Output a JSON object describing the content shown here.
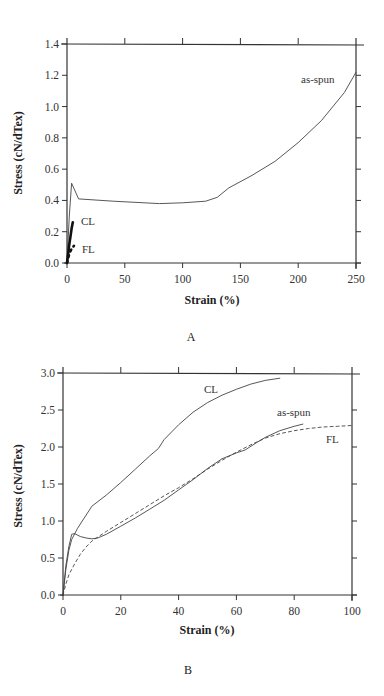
{
  "header": {
    "fragment": "...g ... ...y... ...y..."
  },
  "chart_data": [
    {
      "type": "line",
      "panel": "A",
      "title": "",
      "xlabel": "Strain (%)",
      "ylabel": "Stress (cN/dTex)",
      "xlim": [
        0,
        250
      ],
      "ylim": [
        0,
        1.4
      ],
      "xticks": [
        0,
        50,
        100,
        150,
        200,
        250
      ],
      "yticks": [
        0.0,
        0.2,
        0.4,
        0.6,
        0.8,
        1.0,
        1.2,
        1.4
      ],
      "xtick_labels": [
        "0",
        "50",
        "100",
        "150",
        "200",
        "250"
      ],
      "ytick_labels": [
        "0.0",
        "0.2",
        "0.4",
        "0.6",
        "0.8",
        "1.0",
        "1.2",
        "1.4"
      ],
      "grid": false,
      "legend": "inline labels",
      "series": [
        {
          "name": "as-spun",
          "style": "solid-thin",
          "x": [
            0,
            2,
            4,
            10,
            40,
            80,
            100,
            120,
            130,
            140,
            160,
            180,
            200,
            220,
            240,
            250
          ],
          "y": [
            0.0,
            0.3,
            0.51,
            0.41,
            0.395,
            0.38,
            0.385,
            0.395,
            0.42,
            0.48,
            0.56,
            0.65,
            0.77,
            0.91,
            1.09,
            1.22
          ]
        },
        {
          "name": "CL",
          "style": "solid-thick",
          "x": [
            0,
            1,
            2,
            3,
            4,
            5
          ],
          "y": [
            0.0,
            0.06,
            0.12,
            0.17,
            0.22,
            0.26
          ]
        },
        {
          "name": "FL",
          "style": "dotted-thick",
          "x": [
            0,
            1,
            2,
            4,
            6
          ],
          "y": [
            0.0,
            0.03,
            0.06,
            0.09,
            0.11
          ]
        }
      ],
      "labels": {
        "as_spun": "as-spun",
        "cl": "CL",
        "fl": "FL"
      }
    },
    {
      "type": "line",
      "panel": "B",
      "title": "",
      "xlabel": "Strain (%)",
      "ylabel": "Stress (cN/dTex)",
      "xlim": [
        0,
        100
      ],
      "ylim": [
        0,
        3.0
      ],
      "xticks": [
        0,
        20,
        40,
        60,
        80,
        100
      ],
      "yticks": [
        0.0,
        0.5,
        1.0,
        1.5,
        2.0,
        2.5,
        3.0
      ],
      "xtick_labels": [
        "0",
        "20",
        "40",
        "60",
        "80",
        "100"
      ],
      "ytick_labels": [
        "0.0",
        "0.5",
        "1.0",
        "1.5",
        "2.0",
        "2.5",
        "3.0"
      ],
      "grid": false,
      "legend": "inline labels",
      "series": [
        {
          "name": "CL",
          "style": "solid",
          "x": [
            0,
            1,
            2,
            3,
            5,
            8,
            10,
            15,
            20,
            25,
            30,
            33,
            35,
            40,
            45,
            50,
            55,
            60,
            65,
            70,
            75
          ],
          "y": [
            0.0,
            0.35,
            0.6,
            0.75,
            0.9,
            1.08,
            1.2,
            1.35,
            1.52,
            1.7,
            1.88,
            1.98,
            2.1,
            2.3,
            2.47,
            2.6,
            2.7,
            2.78,
            2.85,
            2.9,
            2.93
          ]
        },
        {
          "name": "as-spun",
          "style": "solid",
          "x": [
            0,
            1,
            2,
            3,
            4,
            6,
            8,
            10,
            12,
            15,
            20,
            25,
            30,
            35,
            40,
            45,
            50,
            55,
            60,
            63,
            67,
            70,
            75,
            80,
            83
          ],
          "y": [
            0.0,
            0.4,
            0.65,
            0.82,
            0.83,
            0.79,
            0.77,
            0.76,
            0.77,
            0.82,
            0.93,
            1.04,
            1.16,
            1.28,
            1.42,
            1.56,
            1.71,
            1.84,
            1.92,
            1.96,
            2.06,
            2.13,
            2.22,
            2.28,
            2.31
          ]
        },
        {
          "name": "FL",
          "style": "dashed",
          "x": [
            0,
            1,
            2,
            4,
            6,
            8,
            10,
            15,
            20,
            25,
            30,
            35,
            40,
            45,
            50,
            55,
            60,
            65,
            70,
            75,
            80,
            85,
            90,
            95,
            100
          ],
          "y": [
            0.0,
            0.15,
            0.27,
            0.42,
            0.55,
            0.65,
            0.73,
            0.86,
            0.98,
            1.1,
            1.22,
            1.34,
            1.45,
            1.57,
            1.7,
            1.82,
            1.93,
            2.03,
            2.12,
            2.18,
            2.22,
            2.25,
            2.27,
            2.28,
            2.29
          ]
        }
      ],
      "labels": {
        "cl": "CL",
        "as_spun": "as-spun",
        "fl": "FL"
      }
    }
  ],
  "panels": {
    "a": {
      "caption": "A",
      "xlabel": "Strain (%)",
      "ylabel": "Stress (cN/dTex)"
    },
    "b": {
      "caption": "B",
      "xlabel": "Strain (%)",
      "ylabel": "Stress (cN/dTex)"
    }
  },
  "colors": {
    "line": "#444444",
    "axis": "#333333",
    "text": "#222222",
    "background": "#ffffff"
  }
}
